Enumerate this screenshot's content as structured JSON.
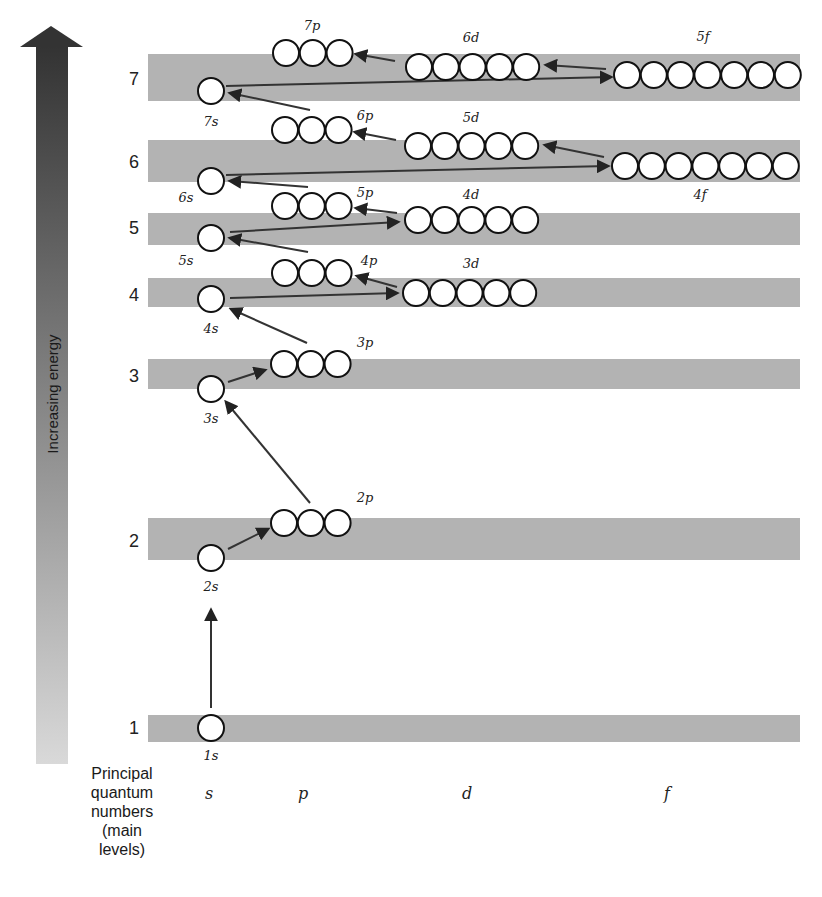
{
  "energy_axis": {
    "label": "Increasing energy",
    "gradient_top": "#333333",
    "gradient_bottom": "#d9d9d9"
  },
  "footer": {
    "principal_label_lines": [
      "Principal",
      "quantum",
      "numbers",
      "(main",
      "levels)"
    ],
    "columns": [
      {
        "label": "s",
        "x": 209
      },
      {
        "label": "p",
        "x": 303
      },
      {
        "label": "d",
        "x": 467
      },
      {
        "label": "f",
        "x": 667
      }
    ]
  },
  "levels": [
    {
      "n": "7",
      "label_y": 85,
      "band_y": 54,
      "band_h": 47,
      "band_x2": 800
    },
    {
      "n": "6",
      "label_y": 168,
      "band_y": 140,
      "band_h": 42,
      "band_x2": 800
    },
    {
      "n": "5",
      "label_y": 234,
      "band_y": 213,
      "band_h": 32,
      "band_x2": 800
    },
    {
      "n": "4",
      "label_y": 301,
      "band_y": 278,
      "band_h": 29,
      "band_x2": 800
    },
    {
      "n": "3",
      "label_y": 382,
      "band_y": 359,
      "band_h": 30,
      "band_x2": 800
    },
    {
      "n": "2",
      "label_y": 547,
      "band_y": 518,
      "band_h": 42,
      "band_x2": 800
    },
    {
      "n": "1",
      "label_y": 734,
      "band_y": 715,
      "band_h": 27,
      "band_x2": 800
    }
  ],
  "orbitals": [
    {
      "name": "1s",
      "boxes": 1,
      "cx": 211,
      "cy": 728,
      "label_x": 211,
      "label_y": 760
    },
    {
      "name": "2s",
      "boxes": 1,
      "cx": 211,
      "cy": 558,
      "label_x": 211,
      "label_y": 591
    },
    {
      "name": "2p",
      "boxes": 3,
      "cx": 284,
      "cy": 523,
      "label_x": 365,
      "label_y": 502
    },
    {
      "name": "3s",
      "boxes": 1,
      "cx": 211,
      "cy": 389,
      "label_x": 211,
      "label_y": 423
    },
    {
      "name": "3p",
      "boxes": 3,
      "cx": 284,
      "cy": 364,
      "label_x": 365,
      "label_y": 347
    },
    {
      "name": "4s",
      "boxes": 1,
      "cx": 211,
      "cy": 299,
      "label_x": 211,
      "label_y": 333
    },
    {
      "name": "3d",
      "boxes": 5,
      "cx": 416,
      "cy": 293,
      "label_x": 471,
      "label_y": 268
    },
    {
      "name": "4p",
      "boxes": 3,
      "cx": 285,
      "cy": 273,
      "label_x": 369,
      "label_y": 265
    },
    {
      "name": "5s",
      "boxes": 1,
      "cx": 211,
      "cy": 238,
      "label_x": 186,
      "label_y": 265
    },
    {
      "name": "4d",
      "boxes": 5,
      "cx": 418,
      "cy": 220,
      "label_x": 471,
      "label_y": 199
    },
    {
      "name": "5p",
      "boxes": 3,
      "cx": 285,
      "cy": 206,
      "label_x": 365,
      "label_y": 197
    },
    {
      "name": "6s",
      "boxes": 1,
      "cx": 211,
      "cy": 181,
      "label_x": 186,
      "label_y": 202
    },
    {
      "name": "4f",
      "boxes": 7,
      "cx": 625,
      "cy": 166,
      "label_x": 700,
      "label_y": 199
    },
    {
      "name": "5d",
      "boxes": 5,
      "cx": 418,
      "cy": 146,
      "label_x": 471,
      "label_y": 122
    },
    {
      "name": "6p",
      "boxes": 3,
      "cx": 285,
      "cy": 130,
      "label_x": 365,
      "label_y": 120
    },
    {
      "name": "7s",
      "boxes": 1,
      "cx": 211,
      "cy": 91,
      "label_x": 211,
      "label_y": 126
    },
    {
      "name": "5f",
      "boxes": 7,
      "cx": 627,
      "cy": 75,
      "label_x": 703,
      "label_y": 41
    },
    {
      "name": "6d",
      "boxes": 5,
      "cx": 419,
      "cy": 67,
      "label_x": 471,
      "label_y": 42
    },
    {
      "name": "7p",
      "boxes": 3,
      "cx": 286,
      "cy": 53,
      "label_x": 312,
      "label_y": 30
    }
  ],
  "orbital_spacing": 26.8,
  "orbital_radius": 13,
  "filling_arrows": [
    {
      "from": "1s",
      "to": "2s",
      "x1": 211,
      "y1": 708,
      "x2": 211,
      "y2": 610
    },
    {
      "from": "2s",
      "to": "2p",
      "x1": 228,
      "y1": 549,
      "x2": 268,
      "y2": 529
    },
    {
      "from": "2p",
      "to": "3s",
      "x1": 310,
      "y1": 503,
      "x2": 226,
      "y2": 402
    },
    {
      "from": "3s",
      "to": "3p",
      "x1": 228,
      "y1": 382,
      "x2": 265,
      "y2": 370
    },
    {
      "from": "3p",
      "to": "4s",
      "x1": 307,
      "y1": 343,
      "x2": 231,
      "y2": 309
    },
    {
      "from": "4s",
      "to": "3d",
      "x1": 230,
      "y1": 298,
      "x2": 397,
      "y2": 293
    },
    {
      "from": "3d",
      "to": "4p",
      "x1": 397,
      "y1": 287,
      "x2": 357,
      "y2": 276
    },
    {
      "from": "4p",
      "to": "5s",
      "x1": 308,
      "y1": 252,
      "x2": 230,
      "y2": 238
    },
    {
      "from": "5s",
      "to": "4d",
      "x1": 230,
      "y1": 232,
      "x2": 398,
      "y2": 222
    },
    {
      "from": "4d",
      "to": "5p",
      "x1": 397,
      "y1": 213,
      "x2": 356,
      "y2": 208
    },
    {
      "from": "5p",
      "to": "6s",
      "x1": 308,
      "y1": 187,
      "x2": 230,
      "y2": 181
    },
    {
      "from": "6s",
      "to": "4f",
      "x1": 226,
      "y1": 175,
      "x2": 608,
      "y2": 166
    },
    {
      "from": "4f",
      "to": "5d",
      "x1": 604,
      "y1": 157,
      "x2": 545,
      "y2": 145
    },
    {
      "from": "5d",
      "to": "6p",
      "x1": 396,
      "y1": 140,
      "x2": 355,
      "y2": 132
    },
    {
      "from": "6p",
      "to": "7s",
      "x1": 310,
      "y1": 110,
      "x2": 230,
      "y2": 93
    },
    {
      "from": "7s",
      "to": "5f",
      "x1": 226,
      "y1": 86,
      "x2": 611,
      "y2": 77
    },
    {
      "from": "5f",
      "to": "6d",
      "x1": 606,
      "y1": 69,
      "x2": 546,
      "y2": 65
    },
    {
      "from": "6d",
      "to": "7p",
      "x1": 395,
      "y1": 61,
      "x2": 356,
      "y2": 54
    }
  ]
}
